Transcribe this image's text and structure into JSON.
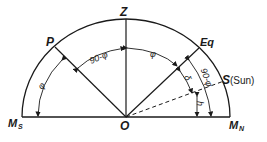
{
  "diagram": {
    "points": {
      "zenith": "Z",
      "pole": "P",
      "equator": "Eq",
      "sun": "S",
      "sun_note": "(Sun)",
      "origin": "O",
      "south_meridian": "M",
      "south_sub": "S",
      "north_meridian": "M",
      "north_sub": "N"
    },
    "angles": {
      "pole_altitude": "φ",
      "pole_zenith": "90-φ",
      "zenith_equator": "φ",
      "equator_altitude": "90-φ",
      "declination": "δ",
      "sun_altitude": "h"
    },
    "colors": {
      "line": "#1a1a1a",
      "background": "#ffffff"
    }
  }
}
